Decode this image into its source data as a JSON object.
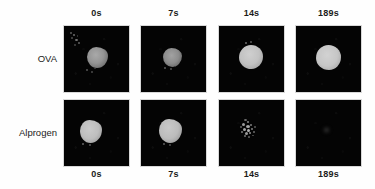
{
  "figure": {
    "name": "mast-cell-degranulation-time-series",
    "background_color": "#fefefe",
    "panel_background_color": "#040404",
    "signal_color": "#c8c8c8"
  },
  "columns": {
    "top_labels": [
      "0s",
      "7s",
      "14s",
      "189s"
    ],
    "bottom_labels": [
      "0s",
      "7s",
      "14s",
      "189s"
    ]
  },
  "rows": [
    {
      "label": "OVA"
    },
    {
      "label": "Alprogen"
    }
  ],
  "panels": [
    {
      "row": "OVA",
      "time": "0s",
      "appearance": "medium-gray irregular cell blob right of center with faint specks upper-left",
      "intensity": "medium"
    },
    {
      "row": "OVA",
      "time": "7s",
      "appearance": "small dim irregular cell blob near center",
      "intensity": "medium-low"
    },
    {
      "row": "OVA",
      "time": "14s",
      "appearance": "bright round cell blob slightly left of center",
      "intensity": "high"
    },
    {
      "row": "OVA",
      "time": "189s",
      "appearance": "bright large round cell blob center",
      "intensity": "high"
    },
    {
      "row": "Alprogen",
      "time": "0s",
      "appearance": "bright irregular cell blob left of center",
      "intensity": "high"
    },
    {
      "row": "Alprogen",
      "time": "7s",
      "appearance": "bright irregular cell blob slightly left of center",
      "intensity": "high"
    },
    {
      "row": "Alprogen",
      "time": "14s",
      "appearance": "dim fragmented speckled signal near center",
      "intensity": "low"
    },
    {
      "row": "Alprogen",
      "time": "189s",
      "appearance": "essentially black, trace residual speck",
      "intensity": "none"
    }
  ]
}
